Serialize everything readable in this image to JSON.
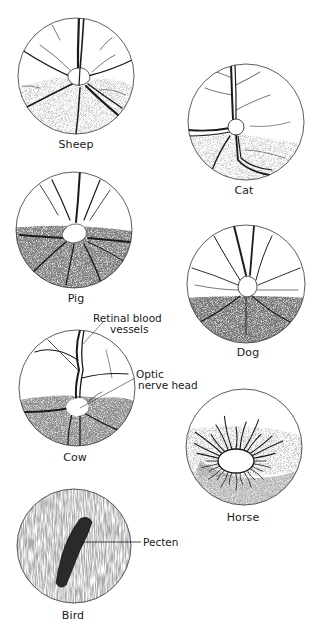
{
  "figure": {
    "panels": [
      {
        "id": "sheep",
        "label": "Sheep",
        "tapetum": "lower-half stippled",
        "disc": "small irregular white disc"
      },
      {
        "id": "cat",
        "label": "Cat",
        "tapetum": "lower-half stippled",
        "disc": "small round disc"
      },
      {
        "id": "pig",
        "label": "Pig",
        "tapetum": "dark lower pigmented fundus",
        "disc": "white disc at horizon"
      },
      {
        "id": "dog",
        "label": "Dog",
        "tapetum": "dark stippled lower half",
        "disc": "irregular disc"
      },
      {
        "id": "cow",
        "label": "Cow",
        "tapetum": "stippled lower half",
        "disc": "white irregular disc"
      },
      {
        "id": "horse",
        "label": "Horse",
        "tapetum": "shaded band",
        "disc": "large oval disc with radial vessels"
      },
      {
        "id": "bird",
        "label": "Bird",
        "tapetum": "uniform striated stippling",
        "disc": "pecten"
      }
    ],
    "annotations": {
      "retinal_vessels_line1": "Retinal blood",
      "retinal_vessels_line2": "vessels",
      "optic_nerve_line1": "Optic",
      "optic_nerve_line2": "nerve head",
      "pecten": "Pecten"
    },
    "colors": {
      "ink": "#1a1a1a",
      "stipple_light": "#9a9a9a",
      "stipple_dark": "#3a3a3a",
      "background": "#ffffff"
    }
  }
}
